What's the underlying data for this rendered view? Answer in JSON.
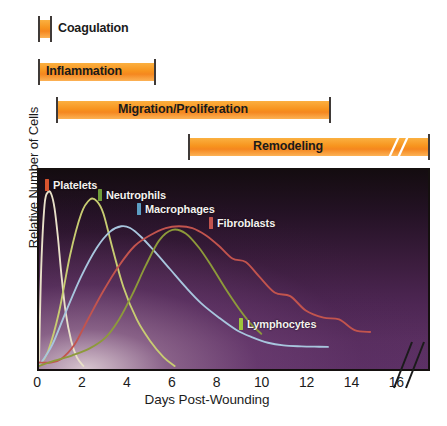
{
  "chart_data": {
    "type": "line",
    "title": "",
    "xlabel": "Days Post-Wounding",
    "ylabel": "Relative Number of Cells",
    "xlim": [
      0,
      17.5
    ],
    "ylim": [
      0,
      1.05
    ],
    "xticks": [
      0,
      2,
      4,
      6,
      8,
      10,
      12,
      14,
      16
    ],
    "xtick_labels": [
      "0",
      "2",
      "4",
      "6",
      "8",
      "10",
      "12",
      "14",
      "16"
    ],
    "yticks": [],
    "grid": false,
    "axis_break_x": 17.0,
    "legend_position": "in-plot",
    "annotations": [
      "Coagulation",
      "Inflammation",
      "Migration/Proliferation",
      "Remodeling"
    ],
    "series": [
      {
        "name": "Platelets",
        "color": "#e8e0c8",
        "x": [
          0,
          0.1,
          0.25,
          0.4,
          0.55,
          0.7,
          0.85,
          1.0,
          1.2,
          1.45,
          1.7,
          2.0
        ],
        "values": [
          0.02,
          0.55,
          0.9,
          0.97,
          0.96,
          0.88,
          0.72,
          0.52,
          0.3,
          0.14,
          0.05,
          0.0
        ]
      },
      {
        "name": "Neutrophils",
        "color": "#c8cc72",
        "x": [
          0,
          0.4,
          0.9,
          1.4,
          1.9,
          2.3,
          2.6,
          2.9,
          3.3,
          3.8,
          4.4,
          5.0,
          5.6,
          6.1
        ],
        "values": [
          0.0,
          0.08,
          0.3,
          0.62,
          0.85,
          0.93,
          0.92,
          0.85,
          0.66,
          0.44,
          0.26,
          0.14,
          0.05,
          0.0
        ]
      },
      {
        "name": "Macrophages",
        "color": "#a8c6de",
        "x": [
          0,
          0.6,
          1.2,
          1.9,
          2.6,
          3.2,
          3.7,
          4.1,
          4.6,
          5.2,
          5.9,
          6.6,
          7.3,
          8.1,
          8.9,
          9.6,
          10.3,
          11.0,
          11.8,
          12.6,
          13.0
        ],
        "values": [
          0.0,
          0.12,
          0.3,
          0.5,
          0.66,
          0.75,
          0.78,
          0.77,
          0.72,
          0.64,
          0.54,
          0.44,
          0.35,
          0.27,
          0.2,
          0.16,
          0.13,
          0.115,
          0.11,
          0.108,
          0.107
        ]
      },
      {
        "name": "Fibroblasts",
        "color": "#c2544e",
        "x": [
          0,
          0.5,
          1.0,
          1.6,
          2.2,
          2.9,
          3.6,
          4.3,
          5.0,
          5.7,
          6.3,
          6.9,
          7.5,
          8.1,
          8.7,
          9.3,
          9.9,
          10.6,
          11.3,
          12.0,
          12.8,
          13.5,
          14.2,
          14.9
        ],
        "values": [
          0.02,
          0.02,
          0.04,
          0.12,
          0.26,
          0.42,
          0.56,
          0.67,
          0.73,
          0.77,
          0.78,
          0.77,
          0.73,
          0.67,
          0.6,
          0.58,
          0.5,
          0.41,
          0.39,
          0.31,
          0.27,
          0.26,
          0.2,
          0.19
        ]
      },
      {
        "name": "Lymphocytes",
        "color": "#8d9a3a",
        "x": [
          0,
          0.7,
          1.5,
          2.3,
          3.0,
          3.6,
          4.2,
          4.8,
          5.4,
          6.0,
          6.6,
          7.2,
          7.8,
          8.4,
          9.0,
          9.5,
          10.0
        ],
        "values": [
          0.0,
          0.03,
          0.06,
          0.1,
          0.16,
          0.26,
          0.4,
          0.56,
          0.7,
          0.76,
          0.74,
          0.66,
          0.55,
          0.43,
          0.32,
          0.24,
          0.18
        ]
      }
    ]
  },
  "phases": [
    {
      "id": "coagulation",
      "label": "Coagulation",
      "label_inside": false,
      "bar_left_px": 38,
      "bar_width_px": 14,
      "label_left_px": 58,
      "top_px": 16
    },
    {
      "id": "inflammation",
      "label": "Inflammation",
      "label_inside": true,
      "bar_left_px": 38,
      "bar_width_px": 118,
      "label_left_px": 46,
      "top_px": 59
    },
    {
      "id": "migration-proliferation",
      "label": "Migration/Proliferation",
      "label_inside": true,
      "bar_left_px": 56,
      "bar_width_px": 275,
      "label_left_px": 118,
      "top_px": 97
    },
    {
      "id": "remodeling",
      "label": "Remodeling",
      "label_inside": true,
      "bar_left_px": 188,
      "bar_width_px": 242,
      "label_left_px": 253,
      "top_px": 134,
      "has_break": true,
      "break_left_px": 196
    }
  ],
  "plot_legend": [
    {
      "name": "Platelets",
      "label": "Platelets",
      "swatch": "#d8542e",
      "left_px": 6,
      "top_px": 9
    },
    {
      "name": "Neutrophils",
      "label": "Neutrophils",
      "swatch": "#6f9c3a",
      "left_px": 59,
      "top_px": 19
    },
    {
      "name": "Macrophages",
      "label": "Macrophages",
      "swatch": "#5c9ec4",
      "left_px": 98,
      "top_px": 33
    },
    {
      "name": "Fibroblasts",
      "label": "Fibroblasts",
      "swatch": "#c2544e",
      "left_px": 170,
      "top_px": 47
    },
    {
      "name": "Lymphocytes",
      "label": "Lymphocytes",
      "swatch": "#9ec63b",
      "left_px": 200,
      "top_px": 148
    }
  ],
  "axes": {
    "x_title": "Days Post-Wounding",
    "y_title": "Relative Number of Cells"
  },
  "colors": {
    "bar_orange": "#f7941e",
    "bar_orange_light": "#fbb040",
    "plot_dark": "#140c10",
    "plot_purple": "#5d3166",
    "axis_black": "#15100f",
    "text_black": "#1b1b1b"
  }
}
